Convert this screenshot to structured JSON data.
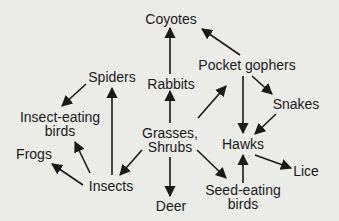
{
  "diagram": {
    "type": "food-web",
    "colors": {
      "background": "#ebebe8",
      "ink": "#1a1a1a"
    },
    "nodes": {
      "coyotes": {
        "label": "Coyotes"
      },
      "pocket_gophers": {
        "label": "Pocket gophers"
      },
      "spiders": {
        "label": "Spiders"
      },
      "rabbits": {
        "label": "Rabbits"
      },
      "snakes": {
        "label": "Snakes"
      },
      "insect_eating_birds": {
        "label_line1": "Insect-eating",
        "label_line2": "birds"
      },
      "grasses_shrubs": {
        "label_line1": "Grasses,",
        "label_line2": "Shrubs"
      },
      "hawks": {
        "label": "Hawks"
      },
      "frogs": {
        "label": "Frogs"
      },
      "lice": {
        "label": "Lice"
      },
      "insects": {
        "label": "Insects"
      },
      "deer": {
        "label": "Deer"
      },
      "seed_eating_birds": {
        "label_line1": "Seed-eating",
        "label_line2": "birds"
      }
    },
    "edges": [
      {
        "from": "Grasses, Shrubs",
        "to": "Rabbits"
      },
      {
        "from": "Grasses, Shrubs",
        "to": "Pocket gophers"
      },
      {
        "from": "Grasses, Shrubs",
        "to": "Insects"
      },
      {
        "from": "Grasses, Shrubs",
        "to": "Deer"
      },
      {
        "from": "Grasses, Shrubs",
        "to": "Seed-eating birds"
      },
      {
        "from": "Rabbits",
        "to": "Coyotes"
      },
      {
        "from": "Pocket gophers",
        "to": "Coyotes"
      },
      {
        "from": "Pocket gophers",
        "to": "Snakes"
      },
      {
        "from": "Pocket gophers",
        "to": "Hawks"
      },
      {
        "from": "Snakes",
        "to": "Hawks"
      },
      {
        "from": "Seed-eating birds",
        "to": "Hawks"
      },
      {
        "from": "Hawks",
        "to": "Lice"
      },
      {
        "from": "Insects",
        "to": "Spiders"
      },
      {
        "from": "Insects",
        "to": "Insect-eating birds"
      },
      {
        "from": "Insects",
        "to": "Frogs"
      },
      {
        "from": "Spiders",
        "to": "Insect-eating birds"
      }
    ]
  }
}
